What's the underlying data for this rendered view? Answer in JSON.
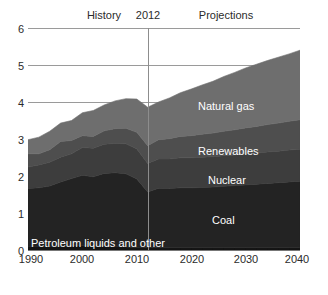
{
  "chart_data": {
    "type": "area",
    "title": "",
    "subtitle": "",
    "xlabel": "",
    "ylabel": "",
    "xlim": [
      1990,
      2040
    ],
    "ylim": [
      0,
      6
    ],
    "grid": true,
    "stacked": true,
    "legend_position": "in-plot",
    "x_ticks": [
      "1990",
      "2000",
      "2010",
      "2020",
      "2030",
      "2040"
    ],
    "x_tick_values": [
      1990,
      2000,
      2010,
      2020,
      2030,
      2040
    ],
    "y_ticks": [
      "0",
      "1",
      "2",
      "3",
      "4",
      "5",
      "6"
    ],
    "y_tick_values": [
      0,
      1,
      2,
      3,
      4,
      5,
      6
    ],
    "annotations": [
      {
        "text": "History",
        "x": 2000
      },
      {
        "text": "2012",
        "x": 2012
      },
      {
        "text": "Projections",
        "x": 2026
      }
    ],
    "divider_x": 2012,
    "x": [
      1990,
      1992,
      1994,
      1996,
      1998,
      2000,
      2002,
      2004,
      2006,
      2008,
      2010,
      2012,
      2014,
      2016,
      2018,
      2020,
      2022,
      2024,
      2026,
      2028,
      2030,
      2032,
      2034,
      2036,
      2038,
      2040
    ],
    "series": [
      {
        "name": "Petroleum liquids and other",
        "color": "#141414",
        "values": [
          0.1,
          0.1,
          0.09,
          0.1,
          0.12,
          0.12,
          0.1,
          0.12,
          0.1,
          0.08,
          0.07,
          0.06,
          0.06,
          0.06,
          0.06,
          0.06,
          0.06,
          0.06,
          0.06,
          0.06,
          0.06,
          0.06,
          0.06,
          0.06,
          0.06,
          0.06
        ]
      },
      {
        "name": "Coal",
        "color": "#232323",
        "values": [
          1.56,
          1.58,
          1.64,
          1.74,
          1.81,
          1.9,
          1.88,
          1.95,
          1.99,
          1.98,
          1.85,
          1.51,
          1.61,
          1.6,
          1.62,
          1.62,
          1.63,
          1.64,
          1.66,
          1.68,
          1.7,
          1.72,
          1.74,
          1.76,
          1.78,
          1.8
        ]
      },
      {
        "name": "Nuclear",
        "color": "#3d3d3d",
        "values": [
          0.58,
          0.62,
          0.64,
          0.67,
          0.67,
          0.75,
          0.77,
          0.79,
          0.79,
          0.81,
          0.81,
          0.77,
          0.79,
          0.8,
          0.81,
          0.81,
          0.82,
          0.82,
          0.83,
          0.83,
          0.84,
          0.84,
          0.85,
          0.85,
          0.86,
          0.86
        ]
      },
      {
        "name": "Renewables",
        "color": "#4e4e4e",
        "values": [
          0.36,
          0.3,
          0.34,
          0.42,
          0.36,
          0.32,
          0.32,
          0.36,
          0.4,
          0.42,
          0.45,
          0.48,
          0.52,
          0.55,
          0.58,
          0.6,
          0.62,
          0.64,
          0.66,
          0.68,
          0.7,
          0.72,
          0.74,
          0.76,
          0.78,
          0.8
        ]
      },
      {
        "name": "Natural gas",
        "color": "#6e6e6e",
        "values": [
          0.38,
          0.45,
          0.5,
          0.5,
          0.54,
          0.62,
          0.7,
          0.7,
          0.75,
          0.8,
          0.9,
          1.04,
          1.02,
          1.1,
          1.18,
          1.26,
          1.33,
          1.4,
          1.48,
          1.55,
          1.62,
          1.68,
          1.73,
          1.78,
          1.82,
          1.88
        ]
      }
    ],
    "series_labels": {
      "natural_gas": "Natural gas",
      "renewables": "Renewables",
      "nuclear": "Nuclear",
      "coal": "Coal",
      "petroleum": "Petroleum liquids and other"
    }
  }
}
